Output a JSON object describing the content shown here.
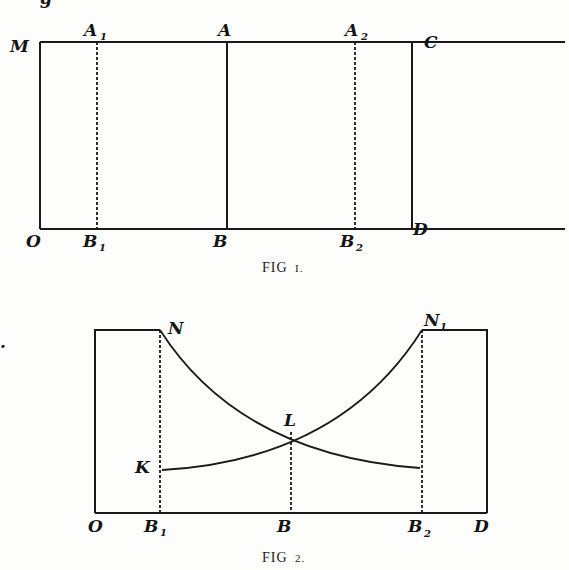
{
  "top_fragment": "g",
  "stray_mark": ".",
  "figure1": {
    "caption_main": "FIG",
    "caption_num": "I.",
    "labels": {
      "M": "M",
      "A1": "A",
      "A1_sub": "1",
      "A": "A",
      "A2": "A",
      "A2_sub": "2",
      "C": "C",
      "O": "O",
      "B1": "B",
      "B1_sub": "1",
      "B": "B",
      "B2": "B",
      "B2_sub": "2",
      "D": "D"
    }
  },
  "figure2": {
    "caption_main": "FIG",
    "caption_num": "2.",
    "labels": {
      "N": "N",
      "N1": "N",
      "N1_sub": "1",
      "L": "L",
      "K": "K",
      "O": "O",
      "B1": "B",
      "B1_sub": "1",
      "B": "B",
      "B2": "B",
      "B2_sub": "2",
      "D": "D"
    }
  }
}
